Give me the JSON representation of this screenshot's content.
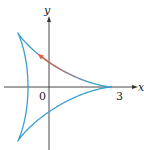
{
  "figure": {
    "type": "parametric curve (deltoid)",
    "axes": {
      "x_label": "x",
      "y_label": "y",
      "origin_label": "0",
      "x_tick_label": "3"
    },
    "curve_color": "#3a9fd0",
    "arrow_color": "#e0604a",
    "axis_color": "#333333"
  }
}
